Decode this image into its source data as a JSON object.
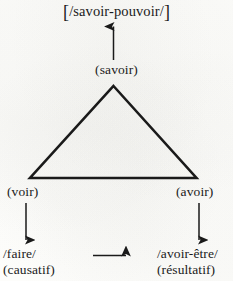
{
  "diagram": {
    "title_term": "[/savoir-pouvoir/]",
    "title_open_bracket": "[",
    "title_inner": "/savoir-pouvoir/",
    "title_close_bracket": "]",
    "apex_term": "(savoir)",
    "left_vertex_term": "(voir)",
    "right_vertex_term": "(avoir)",
    "left_output_term": "/faire/",
    "left_output_gloss": "(causatif)",
    "right_output_term": "/avoir-être/",
    "right_output_gloss": "(résultatif)",
    "ink_color": "#1a1a1a",
    "background_color": "#fdfdfb",
    "shape": "triangle",
    "arrows": [
      {
        "name": "apex-up-arrow",
        "direction": "up"
      },
      {
        "name": "left-down-arrow",
        "direction": "down"
      },
      {
        "name": "right-down-arrow",
        "direction": "down"
      },
      {
        "name": "middle-right-arrow",
        "direction": "right"
      }
    ]
  }
}
